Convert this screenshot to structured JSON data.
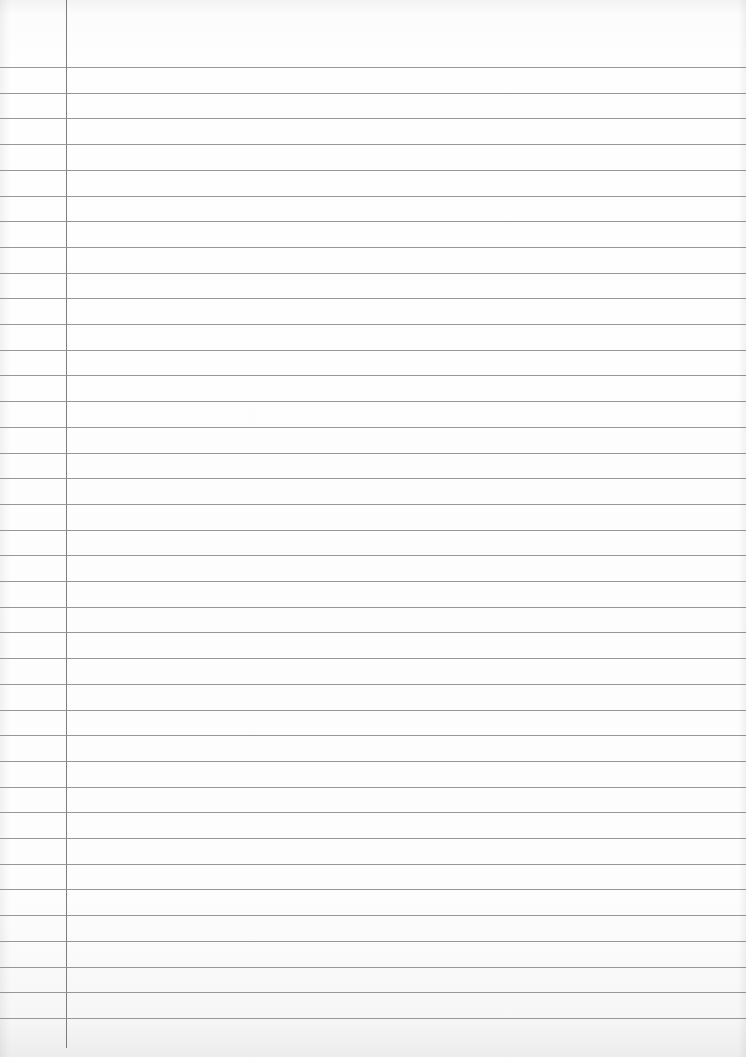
{
  "document": {
    "type": "lined-paper",
    "ruled_lines": {
      "count": 38,
      "first_y": 67,
      "spacing": 25.7,
      "color": "#8c8c8c"
    },
    "margin_line": {
      "x": 66,
      "color": "#7e7e7e"
    },
    "paper_color": "#fdfdfd",
    "text": []
  }
}
